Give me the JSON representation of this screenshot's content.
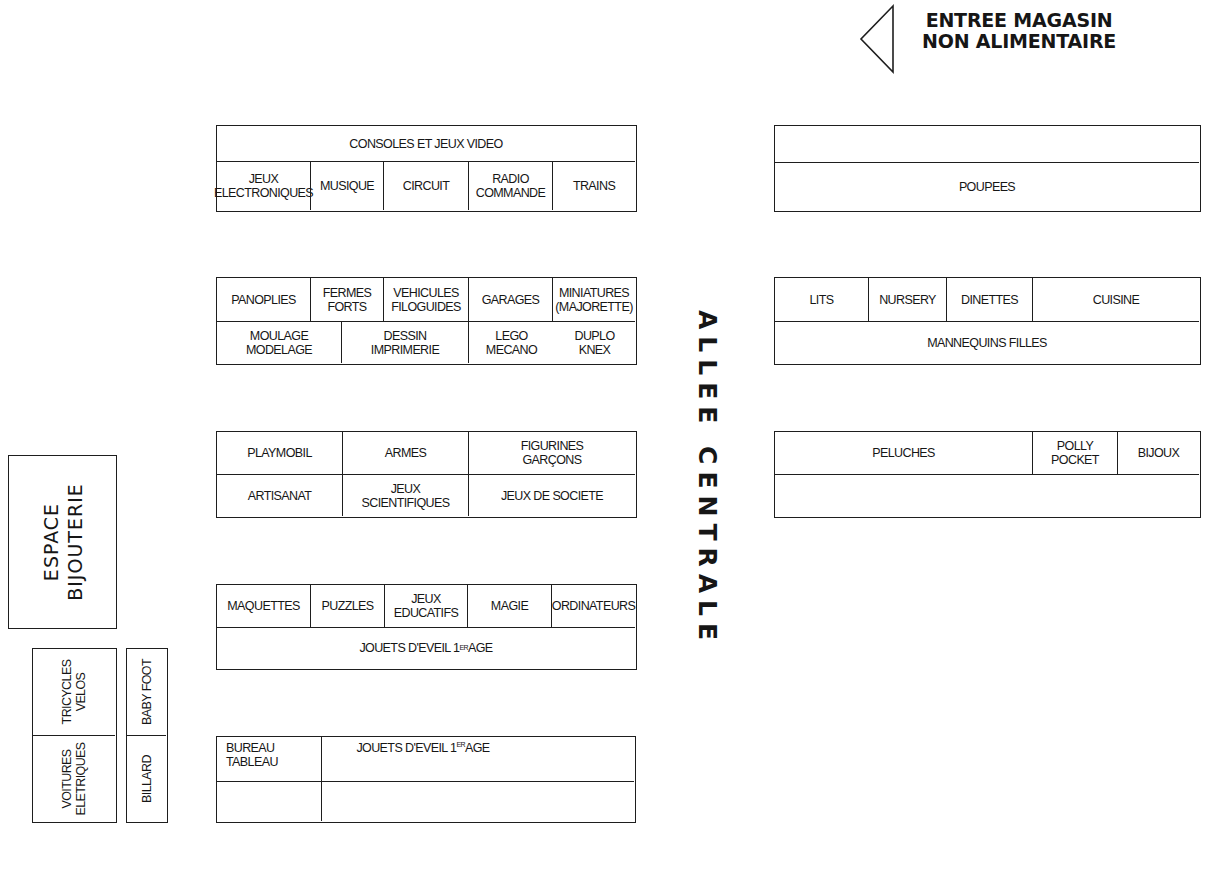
{
  "entrance": {
    "label": "ENTREE MAGASIN\nNON ALIMENTAIRE",
    "arrow_icon": "triangle-left-outline"
  },
  "aisle": {
    "label": "ALLEE CENTRALE"
  },
  "left_column": {
    "block1": {
      "header": "CONSOLES ET JEUX VIDEO",
      "cells": [
        "JEUX\nELECTRONIQUES",
        "MUSIQUE",
        "CIRCUIT",
        "RADIO\nCOMMANDE",
        "TRAINS"
      ]
    },
    "block2": {
      "row1": [
        "PANOPLIES",
        "FERMES\nFORTS",
        "VEHICULES\nFILOGUIDES",
        "GARAGES",
        "MINIATURES\n(MAJORETTE)"
      ],
      "row2": [
        "MOULAGE\nMODELAGE",
        "DESSIN\nIMPRIMERIE",
        "LEGO\nMECANO",
        "DUPLO\nKNEX"
      ]
    },
    "block3": {
      "row1": [
        "PLAYMOBIL",
        "ARMES",
        "FIGURINES\nGARÇONS"
      ],
      "row2": [
        "ARTISANAT",
        "JEUX\nSCIENTIFIQUES",
        "JEUX DE SOCIETE"
      ]
    },
    "block4": {
      "row1": [
        "MAQUETTES",
        "PUZZLES",
        "JEUX\nEDUCATIFS",
        "MAGIE",
        "ORDINATEURS"
      ],
      "row2_main": "JOUETS D'EVEIL 1",
      "row2_sup": "ER",
      "row2_tail": " AGE"
    },
    "block5": {
      "cell_left": "BUREAU\nTABLEAU",
      "cell_right_main": "JOUETS D'EVEIL 1",
      "cell_right_sup": "ER",
      "cell_right_tail": " AGE"
    }
  },
  "right_column": {
    "block1": {
      "row1": "",
      "row2": "POUPEES"
    },
    "block2": {
      "row1": [
        "LITS",
        "NURSERY",
        "DINETTES",
        "CUISINE"
      ],
      "row2": "MANNEQUINS FILLES"
    },
    "block3": {
      "row1": [
        "PELUCHES",
        "POLLY\nPOCKET",
        "BIJOUX"
      ],
      "row2": ""
    }
  },
  "side_area": {
    "jewelry": "ESPACE\nBIJOUTERIE",
    "tricycles": "TRICYCLES\nVELOS",
    "electric_cars": "VOITURES\nELETRIQUES",
    "baby_foot": "BABY FOOT",
    "billard": "BILLARD"
  },
  "colors": {
    "line": "#1e1e1e",
    "text": "#161616",
    "background": "#ffffff"
  }
}
